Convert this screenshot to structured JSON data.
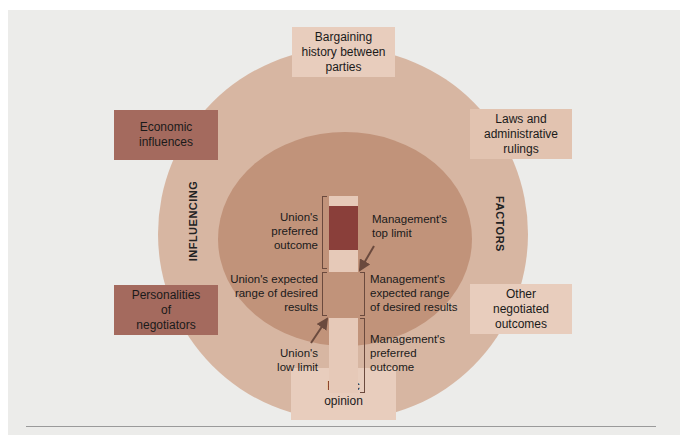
{
  "diagram": {
    "outer_ring_labels": {
      "left": "INFLUENCING",
      "right": "FACTORS"
    },
    "factor_boxes": [
      {
        "id": "bargaining-history",
        "label": "Bargaining\nhistory between\nparties",
        "position": "top",
        "color": "#e8cdbd"
      },
      {
        "id": "economic-influences",
        "label": "Economic\ninfluences",
        "position": "upper-left",
        "color": "#a46a5e"
      },
      {
        "id": "laws-rulings",
        "label": "Laws and\nadministrative\nrulings",
        "position": "upper-right",
        "color": "#e2c3b0"
      },
      {
        "id": "personalities",
        "label": "Personalities\nof\nnegotiators",
        "position": "lower-left",
        "color": "#a46a5e"
      },
      {
        "id": "other-outcomes",
        "label": "Other\nnegotiated\noutcomes",
        "position": "lower-right",
        "color": "#e8cdbd"
      },
      {
        "id": "public-opinion",
        "label": "Public\nopinion",
        "position": "bottom",
        "color": "#e8cdbd"
      }
    ],
    "bargaining_zone": {
      "left_labels": [
        {
          "id": "union-preferred",
          "label": "Union's\npreferred\noutcome"
        },
        {
          "id": "union-expected",
          "label": "Union's expected\nrange of desired\nresults"
        },
        {
          "id": "union-low-limit",
          "label": "Union's\nlow limit"
        }
      ],
      "right_labels": [
        {
          "id": "mgmt-top-limit",
          "label": "Management's\ntop limit"
        },
        {
          "id": "mgmt-expected",
          "label": "Management's\nexpected range\nof desired results"
        },
        {
          "id": "mgmt-preferred",
          "label": "Management's\npreferred\noutcome"
        }
      ],
      "bar_segments": [
        {
          "id": "union-zone",
          "color": "#e6c9b8"
        },
        {
          "id": "overlap-zone",
          "color": "#8a3f3a"
        },
        {
          "id": "management-zone",
          "color": "#e6c9b8"
        }
      ]
    },
    "colors": {
      "background": "#ececea",
      "outer_ring": "#d7b6a2",
      "inner_circle": "#c1937a",
      "arrow": "#6b4a3e"
    }
  }
}
